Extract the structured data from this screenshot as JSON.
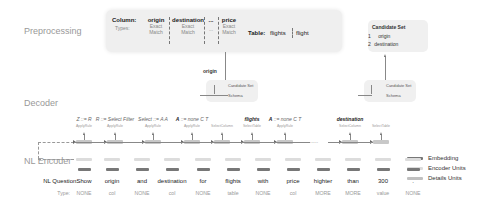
{
  "sections": {
    "preprocessing": "Preprocessing",
    "decoder": "Decoder",
    "nl_encoder": "NL Encoder"
  },
  "preprocessing": {
    "column_label": "Column:",
    "types_label": "Types:",
    "columns": [
      {
        "name": "origin",
        "type_line1": "Exact",
        "type_line2": "Match"
      },
      {
        "name": "destination",
        "type_line1": "Exact",
        "type_line2": "Match"
      },
      {
        "name": "...",
        "type_line1": "...",
        "type_line2": ""
      },
      {
        "name": "price",
        "type_line1": "Exact",
        "type_line2": "Match"
      }
    ],
    "table_label": "Table:",
    "tables": [
      "flights",
      "flight"
    ]
  },
  "candidate_set_right": {
    "title": "Candidate Set",
    "items": [
      {
        "index": "1",
        "value": "origin"
      },
      {
        "index": "2",
        "value": "destination"
      }
    ]
  },
  "selected_column_label": "origin",
  "schema_nodes": {
    "candidate_set": "Candidate Set",
    "schema": "Schema"
  },
  "decoder_steps": [
    {
      "action": "Z ::= R",
      "rule": "ApplyRule"
    },
    {
      "action": "R ::= Select Filter",
      "rule": "ApplyRule"
    },
    {
      "action": "Select ::= A A",
      "rule": "ApplyRule"
    },
    {
      "action_bold": "A",
      "action": "::= none C T",
      "rule": "ApplyRule"
    },
    {
      "action": "",
      "rule": "SelectColumn"
    },
    {
      "action_bold": "flights",
      "action": "",
      "rule": "SelectTable"
    },
    {
      "action_bold": "A",
      "action": "::= none C T",
      "rule": "ApplyRule"
    },
    {
      "action": "......",
      "rule": ""
    },
    {
      "action_bold": "destination",
      "action": "",
      "rule": "SelectColumn"
    },
    {
      "action": "",
      "rule": "SelectTable"
    }
  ],
  "nl_question": {
    "label": "NL Question:",
    "type_label": "Type:",
    "tokens": [
      {
        "word": "Show",
        "type": "NONE"
      },
      {
        "word": "origin",
        "type": "col"
      },
      {
        "word": "and",
        "type": "NONE"
      },
      {
        "word": "destination",
        "type": "col"
      },
      {
        "word": "for",
        "type": "NONE"
      },
      {
        "word": "flights",
        "type": "table"
      },
      {
        "word": "with",
        "type": "NONE"
      },
      {
        "word": "price",
        "type": "col"
      },
      {
        "word": "highter",
        "type": "MORE"
      },
      {
        "word": "than",
        "type": "MORE"
      },
      {
        "word": "300",
        "type": "value"
      },
      {
        "word": ".",
        "type": "NONE"
      }
    ]
  },
  "legend": [
    {
      "label": "Embedding",
      "color": "#777777"
    },
    {
      "label": "Encoder Units",
      "color": "#dcdcdc"
    },
    {
      "label": "Details Units",
      "color": "#c0c0c0"
    }
  ]
}
